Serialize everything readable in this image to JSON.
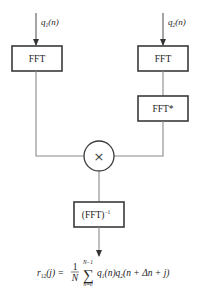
{
  "diagram": {
    "inputs": {
      "left": {
        "var": "q",
        "sub": "1",
        "arg": "(n)"
      },
      "right": {
        "var": "q",
        "sub": "2",
        "arg": "(n)"
      }
    },
    "blocks": {
      "fft_left": "FFT",
      "fft_right": "FFT",
      "fft_conj": "FFT*",
      "multiplier": "×",
      "ifft": "(FFT)",
      "ifft_sup": "−1"
    },
    "output": {
      "lhs_var": "r",
      "lhs_sub": "12",
      "lhs_arg": "(j) =",
      "frac_num": "1",
      "frac_den": "N",
      "sum": "∑",
      "sum_upper": "N−1",
      "sum_lower": "n=0",
      "term1_var": "q",
      "term1_sub": "1",
      "term1_arg": "(n)",
      "term2_var": "q",
      "term2_sub": "2",
      "term2_arg": "(n + Δn + j)"
    }
  }
}
